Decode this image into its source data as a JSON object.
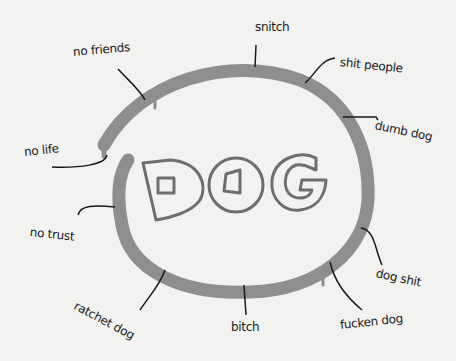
{
  "center": {
    "text": "DOG"
  },
  "colors": {
    "background": "#f2f2f0",
    "ring": "#8a8a8a",
    "ink": "#1a1a1a",
    "letter_stroke": "#6e6e6e"
  },
  "labels": [
    {
      "id": "snitch",
      "text": "snitch"
    },
    {
      "id": "shit-people",
      "text": "shit people"
    },
    {
      "id": "dumb-dog",
      "text": "dumb dog"
    },
    {
      "id": "dog-shit",
      "text": "dog shit"
    },
    {
      "id": "fucken-dog",
      "text": "fucken dog"
    },
    {
      "id": "bitch",
      "text": "bitch"
    },
    {
      "id": "ratchet-dog",
      "text": "ratchet dog"
    },
    {
      "id": "no-trust",
      "text": "no trust"
    },
    {
      "id": "no-life",
      "text": "no life"
    },
    {
      "id": "no-friends",
      "text": "no friends"
    }
  ]
}
